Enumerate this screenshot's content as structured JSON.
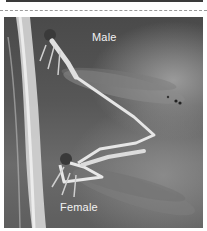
{
  "image": {
    "subject": "Mating pair of damselflies on a grass stem",
    "style": "grayscale photograph",
    "labels": {
      "male": "Male",
      "female": "Female"
    }
  },
  "colors": {
    "background": "#ffffff",
    "divider": "#9a9a9a",
    "label_text": "#f2f2f2"
  }
}
